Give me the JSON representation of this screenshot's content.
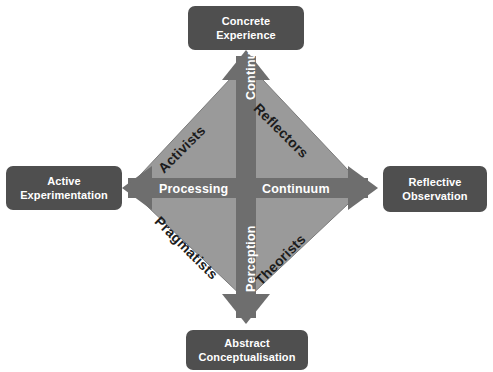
{
  "diagram": {
    "colors": {
      "background": "#ffffff",
      "node_fill": "#4f4f4f",
      "node_text": "#ffffff",
      "diamond_fill": "#9a9a9a",
      "diamond_stroke": "#7b7b7b",
      "arrow_fill": "#6e6e6e",
      "arrow_text": "#ffffff",
      "quadrant_text": "#1c1c1c"
    },
    "nodes": [
      {
        "id": "concrete-experience",
        "lines": [
          "Concrete",
          "Experience"
        ],
        "position": "top"
      },
      {
        "id": "reflective-observation",
        "lines": [
          "Reflective",
          "Observation"
        ],
        "position": "right"
      },
      {
        "id": "abstract-conceptualisation",
        "lines": [
          "Abstract",
          "Conceptualisation"
        ],
        "position": "bottom"
      },
      {
        "id": "active-experimentation",
        "lines": [
          "Active",
          "Experimentation"
        ],
        "position": "left"
      }
    ],
    "axis_labels": {
      "processing": "Processing",
      "continuum_horizontal": "Continuum",
      "continuum_vertical": "Continuum",
      "perception": "Perception"
    },
    "quadrants": [
      {
        "id": "activists",
        "label": "Activists",
        "position": "top-left"
      },
      {
        "id": "reflectors",
        "label": "Reflectors",
        "position": "top-right"
      },
      {
        "id": "pragmatists",
        "label": "Pragmatists",
        "position": "bottom-left"
      },
      {
        "id": "theorists",
        "label": "Theorists",
        "position": "bottom-right"
      }
    ],
    "arrows": [
      {
        "id": "arrow-up",
        "direction": "up",
        "points_to": "concrete-experience"
      },
      {
        "id": "arrow-down",
        "direction": "down",
        "points_to": "abstract-conceptualisation"
      },
      {
        "id": "arrow-left",
        "direction": "left",
        "points_to": "active-experimentation"
      },
      {
        "id": "arrow-right",
        "direction": "right",
        "points_to": "reflective-observation"
      }
    ]
  }
}
